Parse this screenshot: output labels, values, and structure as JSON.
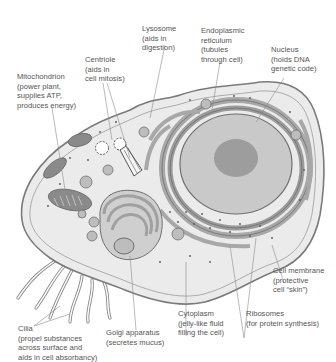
{
  "diagram": {
    "colors": {
      "background": "#ffffff",
      "cytoplasm": "#ececec",
      "membrane_stroke": "#777777",
      "organelle_dark": "#8a8a8a",
      "organelle_mid": "#b4b4b4",
      "nucleus": "#c9c9c9",
      "nucleolus": "#9d9d9d",
      "label_text": "#555555",
      "leader_line": "#8c8c8c"
    },
    "labels": [
      {
        "id": "lysosome",
        "name": "Lysosome",
        "lines": [
          "Lysosome",
          "(aids in",
          "digestion)"
        ]
      },
      {
        "id": "endoplasmic-reticulum",
        "name": "Endoplasmic reticulum",
        "lines": [
          "Endoplasmic",
          "reticulum",
          "(tubules",
          "through cell)"
        ]
      },
      {
        "id": "nucleus",
        "name": "Nucleus",
        "lines": [
          "Nucleus",
          "(holds DNA",
          "genetic code)"
        ]
      },
      {
        "id": "centriole",
        "name": "Centriole",
        "lines": [
          "Centriole",
          "(aids in",
          "cell mitosis)"
        ]
      },
      {
        "id": "mitochondrion",
        "name": "Mitochondrion",
        "lines": [
          "Mitochondrion",
          "(power plant,",
          "supplies ATP,",
          "produces energy)"
        ]
      },
      {
        "id": "cell-membrane",
        "name": "Cell membrane",
        "lines": [
          "Cell membrane",
          "(protective",
          "cell “skin”)"
        ]
      },
      {
        "id": "cilia",
        "name": "Cilia",
        "lines": [
          "Cilia",
          "(propel substances",
          "across surface and",
          "aids in cell absorbancy)"
        ]
      },
      {
        "id": "golgi-apparatus",
        "name": "Golgi apparatus",
        "lines": [
          "Golgi apparatus",
          "(secretes mucus)"
        ]
      },
      {
        "id": "cytoplasm",
        "name": "Cytoplasm",
        "lines": [
          "Cytoplasm",
          "(jelly-like fluid",
          "filling the cell)"
        ]
      },
      {
        "id": "ribosomes",
        "name": "Ribosomes",
        "lines": [
          "Ribosomes",
          "(for protein synthesis)"
        ]
      }
    ]
  }
}
